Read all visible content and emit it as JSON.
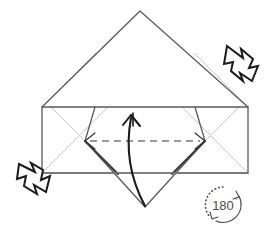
{
  "figure": {
    "type": "origami-fold-diagram",
    "background_color": "#ffffff"
  },
  "colors": {
    "outline": "#5a5a5a",
    "crease_light": "#c8c8c8",
    "edge_dark": "#404040",
    "fold_line": "#333333",
    "arrow_stroke": "#1a1a1a",
    "arrow_fill": "#ffffff",
    "rotate_symbol": "#4a4a4a",
    "paper_fill": "#ffffff"
  },
  "shapes": {
    "top_flap": {
      "name": "upper-triangle-flap",
      "points": "140,11 248,107 42,107",
      "description": "Large upward triangular flap"
    },
    "body_rect": {
      "name": "horizontal-band",
      "x": 42,
      "y": 107,
      "width": 206,
      "height": 66,
      "description": "Horizontal rectangular band of paper"
    },
    "center_diamond": {
      "name": "center-diamond-flap",
      "points": "145,107 205,141 145,207 85,141",
      "description": "Rotated square flap hanging below the band"
    }
  },
  "creases": [
    {
      "name": "crease-left-upper",
      "points": "42,107 95,54",
      "style": "light"
    },
    {
      "name": "crease-right-upper",
      "points": "248,107 195,54",
      "style": "light"
    },
    {
      "name": "crease-left-lower",
      "points": "42,173 108,107",
      "style": "light"
    },
    {
      "name": "crease-right-lower",
      "points": "248,173 182,107",
      "style": "light"
    },
    {
      "name": "crease-diamond-left-inner",
      "points": "85,141 42,107",
      "style": "light"
    },
    {
      "name": "crease-diamond-right-inner",
      "points": "205,141 248,107",
      "style": "light"
    }
  ],
  "fold_line": {
    "name": "valley-fold-dashed-line",
    "x1": 85,
    "y1": 141,
    "x2": 205,
    "y2": 141,
    "style": "dashed",
    "dash_pattern": "7,5",
    "has_arrowheads": true,
    "description": "Dashed horizontal valley fold across the diamond"
  },
  "arrows": {
    "fold_arrow": {
      "name": "fold-up-curved-arrow",
      "label": "",
      "direction": "bottom-to-top",
      "description": "Curved arrow showing the diamond tip folding upward"
    },
    "pull_arrow_top_right": {
      "name": "pull-out-arrow-upper-right",
      "direction": "up-left",
      "description": "Jagged pull-out arrow at the upper right"
    },
    "pull_arrow_bottom_left": {
      "name": "pull-out-arrow-lower-left",
      "direction": "down-right",
      "description": "Jagged pull-out arrow at the lower left"
    }
  },
  "rotate_symbol": {
    "name": "rotate-180-symbol",
    "value": "180",
    "degree_glyph": "°",
    "center_x": 223,
    "center_y": 205,
    "radius": 18,
    "description": "Circular arrow symbol indicating a 180 degree turn over"
  }
}
